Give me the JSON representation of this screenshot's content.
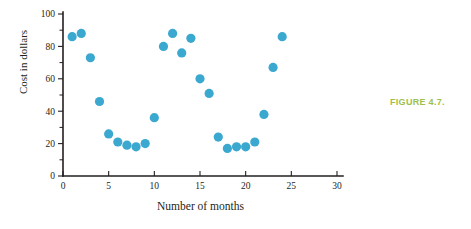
{
  "figure": {
    "caption": "FIGURE 4.7.",
    "caption_color": "#9dc04a"
  },
  "chart_data": {
    "type": "scatter",
    "title": "",
    "xlabel": "Number of months",
    "ylabel": "Cost in dollars",
    "xlim": [
      0,
      30
    ],
    "ylim": [
      0,
      100
    ],
    "x_ticks": [
      0,
      5,
      10,
      15,
      20,
      25,
      30
    ],
    "y_ticks": [
      0,
      20,
      40,
      60,
      80,
      100
    ],
    "x_tick_labels": [
      "0",
      "5",
      "10",
      "15",
      "20",
      "25",
      "30"
    ],
    "y_tick_labels": [
      "0",
      "20",
      "40",
      "60",
      "80",
      "100"
    ],
    "x_minor_step": 1,
    "y_minor_step": 10,
    "grid": false,
    "legend": false,
    "marker_color": "#3ba8d0",
    "marker_size": 4.6,
    "series": [
      {
        "name": "Cost",
        "points": [
          {
            "x": 1,
            "y": 86
          },
          {
            "x": 2,
            "y": 88
          },
          {
            "x": 3,
            "y": 73
          },
          {
            "x": 4,
            "y": 46
          },
          {
            "x": 5,
            "y": 26
          },
          {
            "x": 6,
            "y": 21
          },
          {
            "x": 7,
            "y": 19
          },
          {
            "x": 8,
            "y": 18
          },
          {
            "x": 9,
            "y": 20
          },
          {
            "x": 10,
            "y": 36
          },
          {
            "x": 11,
            "y": 80
          },
          {
            "x": 12,
            "y": 88
          },
          {
            "x": 13,
            "y": 76
          },
          {
            "x": 14,
            "y": 85
          },
          {
            "x": 15,
            "y": 60
          },
          {
            "x": 16,
            "y": 51
          },
          {
            "x": 17,
            "y": 24
          },
          {
            "x": 18,
            "y": 17
          },
          {
            "x": 19,
            "y": 18
          },
          {
            "x": 20,
            "y": 18
          },
          {
            "x": 21,
            "y": 21
          },
          {
            "x": 22,
            "y": 38
          },
          {
            "x": 23,
            "y": 67
          },
          {
            "x": 24,
            "y": 86
          }
        ]
      }
    ]
  }
}
